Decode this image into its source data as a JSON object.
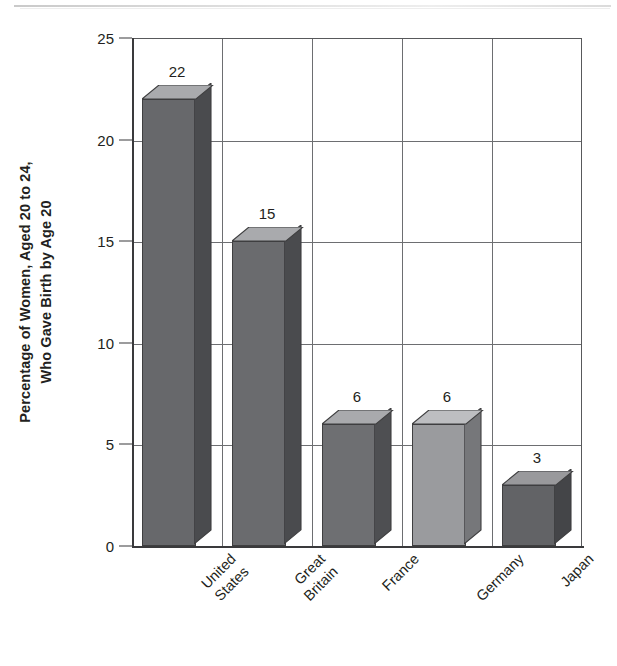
{
  "chart_data": {
    "type": "bar",
    "title": "",
    "subtitle": "",
    "xlabel": "",
    "ylabel": "Percentage of Women, Aged 20 to 24, Who Gave Birth by Age 20",
    "ylabel_lines": [
      "Percentage of Women, Aged 20 to 24,",
      "Who Gave Birth by Age 20"
    ],
    "categories": [
      "United States",
      "Great Britain",
      "France",
      "Germany",
      "Japan"
    ],
    "category_lines": [
      [
        "United",
        "States"
      ],
      [
        "Great",
        "Britain"
      ],
      [
        "France"
      ],
      [
        "Germany"
      ],
      [
        "Japan"
      ]
    ],
    "values": [
      22,
      15,
      6,
      6,
      3
    ],
    "data_labels": [
      "22",
      "15",
      "6",
      "6",
      "3"
    ],
    "ylim": [
      0,
      25
    ],
    "yticks": [
      0,
      5,
      10,
      15,
      20,
      25
    ],
    "ytick_labels": [
      "0",
      "5",
      "10",
      "15",
      "20",
      "25"
    ],
    "grid": "horizontal-and-vertical",
    "legend": "none",
    "style": "3d-bars-grayscale",
    "bar_colors": [
      "#67686b",
      "#6a6b6e",
      "#6e6f72",
      "#9a9b9e",
      "#626366"
    ],
    "bar_top_colors": [
      "#a9aaad",
      "#a9aaad",
      "#a9aaad",
      "#bdbec1",
      "#99999c"
    ],
    "bar_side_colors": [
      "#4a4b4e",
      "#4a4b4e",
      "#4e4f52",
      "#76777a",
      "#444548"
    ],
    "axis_color": "#3a3a3c",
    "grid_color": "#6d6e71",
    "text_color": "#231f20",
    "background": "#ffffff"
  }
}
